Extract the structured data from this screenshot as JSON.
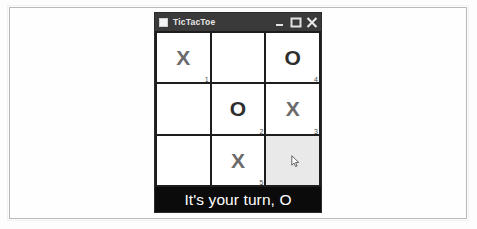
{
  "window": {
    "title": "TicTacToe",
    "icon": "app-window-icon",
    "controls": [
      {
        "name": "minimize-button",
        "glyph": "minimize-icon",
        "label": "_"
      },
      {
        "name": "maximize-button",
        "glyph": "maximize-icon",
        "label": "□"
      },
      {
        "name": "close-button",
        "glyph": "close-icon",
        "label": "×"
      }
    ]
  },
  "board": {
    "cells": [
      {
        "mark": "X",
        "order": "1",
        "hover": false
      },
      {
        "mark": "",
        "order": "",
        "hover": false
      },
      {
        "mark": "O",
        "order": "4",
        "hover": false
      },
      {
        "mark": "",
        "order": "",
        "hover": false
      },
      {
        "mark": "O",
        "order": "2",
        "hover": false
      },
      {
        "mark": "X",
        "order": "3",
        "hover": false
      },
      {
        "mark": "",
        "order": "",
        "hover": false
      },
      {
        "mark": "X",
        "order": "5",
        "hover": false
      },
      {
        "mark": "",
        "order": "",
        "hover": true
      }
    ],
    "cursor_cell": 8,
    "cursor_icon": "mouse-pointer-icon"
  },
  "status": {
    "message": "It's your turn, O"
  },
  "colors": {
    "title_bar": "#3a3a3a",
    "grid_line": "#1d1d1d",
    "cell": "#ffffff",
    "cell_hover": "#e9e9e9",
    "x_mark": "#6b6b6b",
    "o_mark": "#2e2e2e",
    "status_bg": "#0b0b0b",
    "status_fg": "#ffffff"
  }
}
